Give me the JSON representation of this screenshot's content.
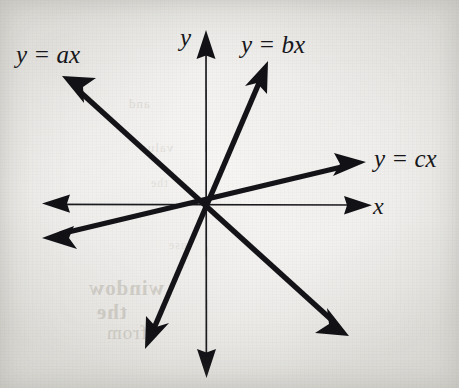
{
  "figure": {
    "type": "line-diagram",
    "background_color": "#f2f1ef",
    "ink_color": "#16161a",
    "canvas": {
      "width": 459,
      "height": 388
    },
    "origin": {
      "x": 206,
      "y": 205
    }
  },
  "axes": {
    "x_axis": {
      "label": "x",
      "label_position": {
        "x": 373,
        "y": 193
      },
      "start": {
        "x": 42,
        "y": 204
      },
      "end": {
        "x": 372,
        "y": 205
      },
      "arrowheads": "both",
      "stroke_width": 1.6
    },
    "y_axis": {
      "label": "y",
      "label_position": {
        "x": 180,
        "y": 24
      },
      "start": {
        "x": 206,
        "y": 30
      },
      "end": {
        "x": 206,
        "y": 378
      },
      "arrowheads": "both",
      "stroke_width": 1.6
    }
  },
  "lines": [
    {
      "id": "line-ax",
      "label": "y = ax",
      "slope_sign": "negative",
      "label_position": {
        "x": 16,
        "y": 41
      },
      "tip_a": {
        "x": 62,
        "y": 76
      },
      "tip_b": {
        "x": 349,
        "y": 336
      },
      "stroke_width": 5.4
    },
    {
      "id": "line-bx",
      "label": "y = bx",
      "slope_sign": "positive-steep",
      "label_position": {
        "x": 241,
        "y": 31
      },
      "tip_a": {
        "x": 268,
        "y": 61
      },
      "tip_b": {
        "x": 145,
        "y": 349
      },
      "stroke_width": 5.4
    },
    {
      "id": "line-cx",
      "label": "y = cx",
      "slope_sign": "positive-shallow",
      "label_position": {
        "x": 374,
        "y": 145
      },
      "tip_a": {
        "x": 366,
        "y": 162
      },
      "tip_b": {
        "x": 42,
        "y": 238
      },
      "stroke_width": 5.0
    }
  ],
  "background_bleedthrough": {
    "note": "faint mirrored show-through text from the reverse of the scanned page",
    "lines": [
      "window",
      "the",
      "from",
      "and",
      "value",
      "the",
      "use"
    ]
  }
}
